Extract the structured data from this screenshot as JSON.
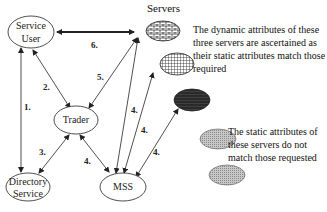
{
  "diagram": {
    "servers_title": "Servers",
    "nodes": {
      "service_user": [
        "Service",
        "User"
      ],
      "trader": "Trader",
      "directory_service": [
        "Directory",
        "Service"
      ],
      "mss": "MSS"
    },
    "steps": {
      "s1": "1.",
      "s2": "2.",
      "s3": "3.",
      "s4a": "4.",
      "s4b": "4.",
      "s4c": "4.",
      "s4d": "4.",
      "s5": "5.",
      "s6": "6."
    },
    "notes": {
      "dynamic": "The dynamic attributes of these three servers are ascertained as their static attributes match those required",
      "static": "The static attributes of these servers do not match those requested"
    },
    "colors": {
      "line": "#222222",
      "dark_server": "#2a2a2a",
      "gray_server": "#b8b8b8"
    }
  }
}
